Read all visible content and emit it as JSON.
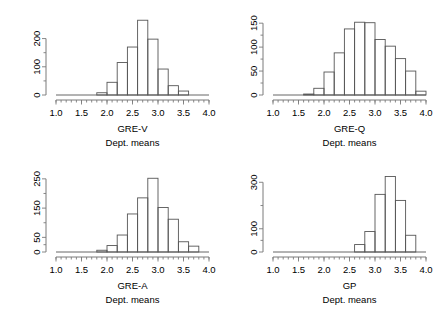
{
  "chart_data": [
    {
      "type": "bar",
      "panel": "top-left",
      "title": "",
      "xlabel": "GRE-V",
      "sublabel": "Dept. means",
      "ylabel": "",
      "xlim": [
        1.0,
        4.0
      ],
      "ylim": [
        0,
        280
      ],
      "grid": false,
      "legend": "none",
      "xticks": [
        "1.0",
        "1.5",
        "2.0",
        "2.5",
        "3.0",
        "3.5",
        "4.0"
      ],
      "xtickvalues": [
        1.0,
        1.5,
        2.0,
        2.5,
        3.0,
        3.5,
        4.0
      ],
      "yticks": [
        "0",
        "100",
        "200"
      ],
      "ytickvalues": [
        0,
        100,
        200
      ],
      "bin_width": 0.2,
      "bin_starts": [
        1.8,
        2.0,
        2.2,
        2.4,
        2.6,
        2.8,
        3.0,
        3.2,
        3.4
      ],
      "values": [
        8,
        45,
        115,
        170,
        265,
        198,
        92,
        33,
        14
      ],
      "categories": [
        "1.8-2.0",
        "2.0-2.2",
        "2.2-2.4",
        "2.4-2.6",
        "2.6-2.8",
        "2.8-3.0",
        "3.0-3.2",
        "3.2-3.4",
        "3.4-3.6"
      ]
    },
    {
      "type": "bar",
      "panel": "top-right",
      "title": "",
      "xlabel": "GRE-Q",
      "sublabel": "Dept. means",
      "ylabel": "",
      "xlim": [
        1.0,
        4.0
      ],
      "ylim": [
        0,
        165
      ],
      "grid": false,
      "legend": "none",
      "xticks": [
        "1.0",
        "1.5",
        "2.0",
        "2.5",
        "3.0",
        "3.5",
        "4.0"
      ],
      "xtickvalues": [
        1.0,
        1.5,
        2.0,
        2.5,
        3.0,
        3.5,
        4.0
      ],
      "yticks": [
        "0",
        "50",
        "100",
        "150"
      ],
      "ytickvalues": [
        0,
        50,
        100,
        150
      ],
      "bin_width": 0.2,
      "bin_starts": [
        1.6,
        1.8,
        2.0,
        2.2,
        2.4,
        2.6,
        2.8,
        3.0,
        3.2,
        3.4,
        3.6,
        3.8
      ],
      "values": [
        2,
        14,
        48,
        88,
        138,
        152,
        151,
        116,
        102,
        76,
        50,
        8
      ],
      "categories": [
        "1.6-1.8",
        "1.8-2.0",
        "2.0-2.2",
        "2.2-2.4",
        "2.4-2.6",
        "2.6-2.8",
        "2.8-3.0",
        "3.0-3.2",
        "3.2-3.4",
        "3.4-3.6",
        "3.6-3.8",
        "3.8-4.0"
      ]
    },
    {
      "type": "bar",
      "panel": "bottom-left",
      "title": "",
      "xlabel": "GRE-A",
      "sublabel": "Dept. means",
      "ylabel": "",
      "xlim": [
        1.0,
        4.0
      ],
      "ylim": [
        0,
        270
      ],
      "grid": false,
      "legend": "none",
      "xticks": [
        "1.0",
        "1.5",
        "2.0",
        "2.5",
        "3.0",
        "3.5",
        "4.0"
      ],
      "xtickvalues": [
        1.0,
        1.5,
        2.0,
        2.5,
        3.0,
        3.5,
        4.0
      ],
      "yticks": [
        "0",
        "50",
        "150",
        "250"
      ],
      "ytickvalues": [
        0,
        50,
        150,
        250
      ],
      "bin_width": 0.2,
      "bin_starts": [
        1.8,
        2.0,
        2.2,
        2.4,
        2.6,
        2.8,
        3.0,
        3.2,
        3.4,
        3.6
      ],
      "values": [
        6,
        22,
        58,
        130,
        185,
        252,
        152,
        112,
        35,
        20
      ],
      "categories": [
        "1.8-2.0",
        "2.0-2.2",
        "2.2-2.4",
        "2.4-2.6",
        "2.6-2.8",
        "2.8-3.0",
        "3.0-3.2",
        "3.2-3.4",
        "3.4-3.6",
        "3.6-3.8"
      ]
    },
    {
      "type": "bar",
      "panel": "bottom-right",
      "title": "",
      "xlabel": "GP",
      "sublabel": "Dept. means",
      "ylabel": "",
      "xlim": [
        1.0,
        4.0
      ],
      "ylim": [
        0,
        340
      ],
      "grid": false,
      "legend": "none",
      "xticks": [
        "1.0",
        "1.5",
        "2.0",
        "2.5",
        "3.0",
        "3.5",
        "4.0"
      ],
      "xtickvalues": [
        1.0,
        1.5,
        2.0,
        2.5,
        3.0,
        3.5,
        4.0
      ],
      "yticks": [
        "0",
        "100",
        "300"
      ],
      "ytickvalues": [
        0,
        100,
        300
      ],
      "bin_width": 0.2,
      "bin_starts": [
        2.6,
        2.8,
        3.0,
        3.2,
        3.4,
        3.6
      ],
      "values": [
        32,
        88,
        248,
        325,
        222,
        72
      ],
      "categories": [
        "2.6-2.8",
        "2.8-3.0",
        "3.0-3.2",
        "3.2-3.4",
        "3.4-3.6",
        "3.6-3.8"
      ]
    }
  ]
}
